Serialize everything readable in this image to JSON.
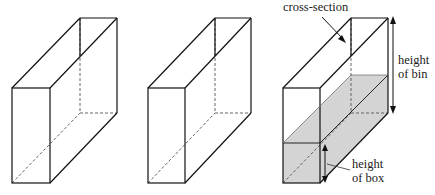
{
  "diagram": {
    "boxes": [
      {
        "id": "box-1",
        "shaded": false
      },
      {
        "id": "box-2",
        "shaded": false
      },
      {
        "id": "box-3",
        "shaded": true
      }
    ],
    "labels": {
      "cross_section": "cross-section",
      "height_of_bin_line1": "height",
      "height_of_bin_line2": "of bin",
      "height_of_box_line1": "height",
      "height_of_box_line2": "of box"
    },
    "colors": {
      "stroke": "#111111",
      "fill_shade": "#d4d4d4",
      "dashed": "#555555"
    }
  }
}
